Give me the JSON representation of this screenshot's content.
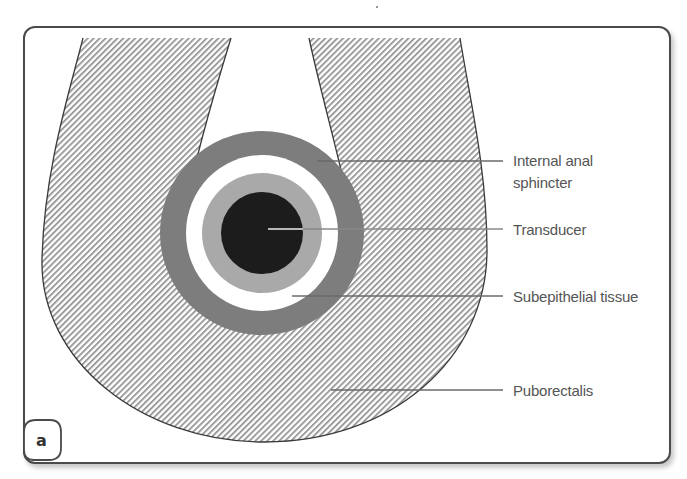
{
  "figure": {
    "panel_label": "a",
    "structures": [
      {
        "id": "puborectalis",
        "label": "Puborectalis",
        "fill": "hatched",
        "hatch_color": "#9a9a9a"
      },
      {
        "id": "internal-anal-sphincter",
        "label_lines": [
          "Internal anal",
          "sphincter"
        ],
        "fill": "#7d7d7d"
      },
      {
        "id": "subepithelial-tissue",
        "label": "Subepithelial tissue",
        "fill": "#ffffff"
      },
      {
        "id": "mucosa-ring",
        "fill": "#a9a9a9"
      },
      {
        "id": "transducer",
        "label": "Transducer",
        "fill": "#1c1c1c"
      }
    ],
    "labels": {
      "internal_anal_sphincter_line1": "Internal anal",
      "internal_anal_sphincter_line2": "sphincter",
      "transducer": "Transducer",
      "subepithelial_tissue": "Subepithelial tissue",
      "puborectalis": "Puborectalis"
    },
    "colors": {
      "outline": "#3a3a3a",
      "hatch": "#9a9a9a",
      "sphincter": "#7d7d7d",
      "mucosa": "#a9a9a9",
      "transducer": "#1c1c1c",
      "leader_line": "#6a6a6a",
      "label_text": "#555555"
    }
  }
}
